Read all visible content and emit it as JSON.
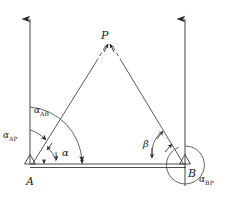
{
  "figure": {
    "type": "survey-triangulation-diagram",
    "stroke_color": "#3a3a3a",
    "text_color": "#1a1a1a",
    "background": "#ffffff"
  },
  "points": {
    "a_label": "A",
    "b_label": "B",
    "p_label": "P"
  },
  "bearings": {
    "alpha_ab_symbol": "α",
    "alpha_ab_sub": "AB",
    "alpha_ap_symbol": "α",
    "alpha_ap_sub": "AP",
    "alpha_bp_symbol": "α",
    "alpha_bp_sub": "BP"
  },
  "angles": {
    "alpha": "α",
    "beta": "β"
  },
  "icons": {
    "north_arrow_left": "north-arrow-icon",
    "north_arrow_right": "north-arrow-icon",
    "station_a": "triangle-station-icon",
    "station_b": "triangle-station-icon"
  }
}
